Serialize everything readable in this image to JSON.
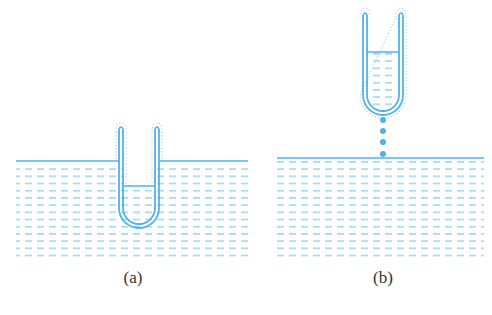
{
  "colors": {
    "line": "#4fb3e8",
    "dash": "#7fcde8",
    "dot": "#9bd4ef",
    "label": "#333333"
  },
  "panels": [
    {
      "id": "a",
      "label": "(a)",
      "description": "U-tube immersed open-end up in liquid bath; liquid inside tube at level below bath surface",
      "bath": {
        "x1": 16,
        "x2": 248,
        "surface_y": 161,
        "bottom_y": 258
      },
      "tube": {
        "left_x": 121,
        "right_x": 157,
        "top_y": 127,
        "bottom_y": 226,
        "inner_level_y": 186
      }
    },
    {
      "id": "b",
      "label": "(b)",
      "description": "U-tube lifted out of bath holding liquid; drops falling from its bottom back into the bath",
      "bath": {
        "x1": 277,
        "x2": 484,
        "surface_y": 158,
        "bottom_y": 258
      },
      "tube": {
        "left_x": 365,
        "right_x": 401,
        "top_y": 12,
        "bottom_y": 113,
        "inner_level_y": 52
      },
      "drops_y": [
        120,
        131,
        142,
        154
      ]
    }
  ]
}
